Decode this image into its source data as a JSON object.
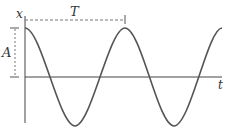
{
  "diagram": {
    "axes": {
      "y_label": "x",
      "x_label": "t"
    },
    "annotations": {
      "period_label": "T",
      "amplitude_label": "A"
    },
    "colors": {
      "curve": "#555555",
      "axis": "#444444",
      "dashed": "#777777"
    }
  }
}
